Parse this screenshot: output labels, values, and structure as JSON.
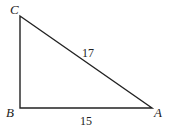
{
  "figure": {
    "type": "right triangle",
    "right_angle_at": "B",
    "vertices": {
      "A": "A",
      "B": "B",
      "C": "C"
    },
    "sides": {
      "CA": "17",
      "BA": "15"
    },
    "line_color": "#222222",
    "background": "#ffffff"
  }
}
